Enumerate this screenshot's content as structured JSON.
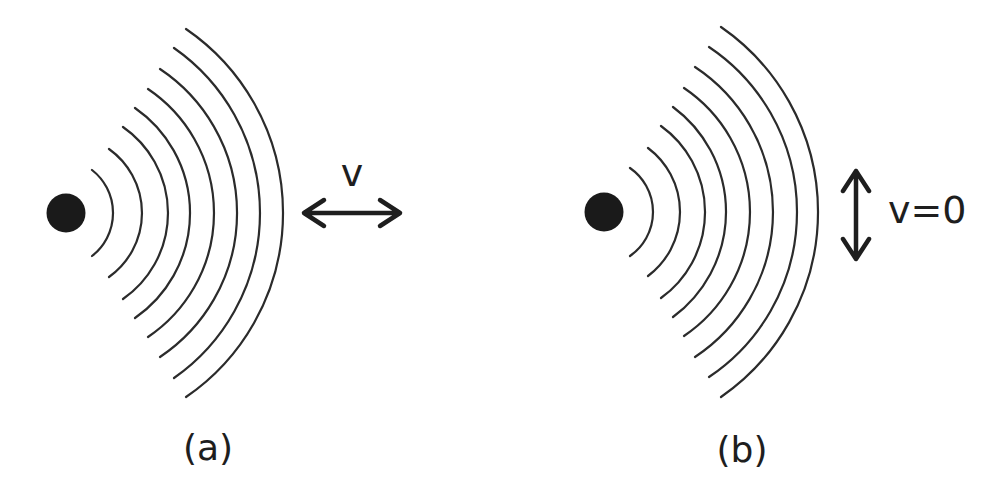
{
  "figure": {
    "background": "#ffffff",
    "ink": "#1e1e1e",
    "panels": [
      {
        "id": "a",
        "caption": "(a)",
        "source": {
          "cx": 66,
          "cy": 213,
          "r": 19.5
        },
        "wave_center_y": 213,
        "wavefronts": [
          {
            "x_apex": 113,
            "x_end": 92,
            "half_height": 43
          },
          {
            "x_apex": 142,
            "x_end": 109,
            "half_height": 64
          },
          {
            "x_apex": 168,
            "x_end": 123,
            "half_height": 86
          },
          {
            "x_apex": 190,
            "x_end": 135,
            "half_height": 105
          },
          {
            "x_apex": 214,
            "x_end": 148,
            "half_height": 124
          },
          {
            "x_apex": 237,
            "x_end": 160,
            "half_height": 144
          },
          {
            "x_apex": 260,
            "x_end": 174,
            "half_height": 165
          },
          {
            "x_apex": 283,
            "x_end": 186,
            "half_height": 184
          }
        ],
        "velocity_arrow": {
          "orientation": "horizontal",
          "x1": 304,
          "x2": 400,
          "y": 213
        },
        "velocity_label": "v",
        "velocity_label_pos": {
          "x": 352,
          "y": 186
        },
        "caption_pos": {
          "x": 208,
          "y": 460
        }
      },
      {
        "id": "b",
        "caption": "(b)",
        "source": {
          "cx": 604,
          "cy": 212,
          "r": 19.5
        },
        "wave_center_y": 212,
        "wavefronts": [
          {
            "x_apex": 653,
            "x_end": 630,
            "half_height": 44
          },
          {
            "x_apex": 680,
            "x_end": 648,
            "half_height": 64
          },
          {
            "x_apex": 705,
            "x_end": 661,
            "half_height": 86
          },
          {
            "x_apex": 726,
            "x_end": 673,
            "half_height": 105
          },
          {
            "x_apex": 750,
            "x_end": 684,
            "half_height": 124
          },
          {
            "x_apex": 773,
            "x_end": 695,
            "half_height": 145
          },
          {
            "x_apex": 797,
            "x_end": 709,
            "half_height": 165
          },
          {
            "x_apex": 818,
            "x_end": 721,
            "half_height": 185
          }
        ],
        "velocity_arrow": {
          "orientation": "vertical",
          "x": 856,
          "y1": 171,
          "y2": 259
        },
        "velocity_label": "v=0",
        "velocity_label_pos": {
          "x": 888,
          "y": 223
        },
        "caption_pos": {
          "x": 742,
          "y": 462
        }
      }
    ]
  }
}
